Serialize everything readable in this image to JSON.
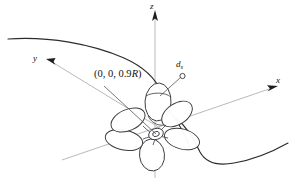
{
  "figure": {
    "type": "technical-line-diagram",
    "background_color": "#ffffff",
    "stroke_color": "#2b2b2e",
    "axis_color": "#b9b9bd"
  },
  "axes": {
    "z": {
      "label": "z",
      "direction": "up"
    },
    "x": {
      "label": "x",
      "direction": "upper-right"
    },
    "y": {
      "label": "y",
      "direction": "upper-left"
    }
  },
  "annotations": {
    "coordinate_point": {
      "label": "(0, 0, 0.9R)",
      "prefix": "(0, 0, 0.9",
      "italic_part": "R",
      "suffix": ")"
    },
    "diameter_marker": {
      "label": "d",
      "subscript": "s"
    }
  },
  "hull": {
    "upper_curve": "sweeping curve from upper-left to the hub region",
    "lower_curve": "s-shaped curve from hub region to lower-right"
  },
  "propeller": {
    "blade_count": 5,
    "hub": "central boss at origin"
  }
}
